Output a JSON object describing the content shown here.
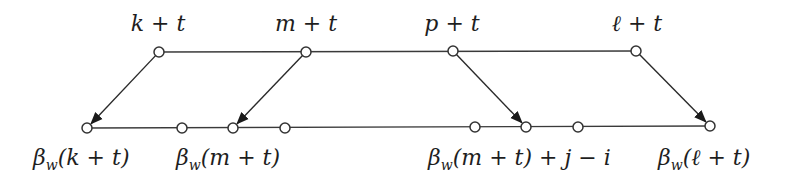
{
  "diagram": {
    "top_row": {
      "y": 52,
      "line": {
        "x1": 159,
        "x2": 636
      },
      "nodes": [
        {
          "id": "k+t",
          "x": 159,
          "y": 52,
          "label": "k + t",
          "label_x": 158,
          "label_y": 31
        },
        {
          "id": "m+t",
          "x": 306,
          "y": 52,
          "label": "m + t",
          "label_x": 306,
          "label_y": 31
        },
        {
          "id": "p+t",
          "x": 453,
          "y": 51,
          "label": "p + t",
          "label_x": 452,
          "label_y": 31
        },
        {
          "id": "l+t",
          "x": 636,
          "y": 51,
          "label": "ℓ + t",
          "label_x": 637,
          "label_y": 31
        }
      ]
    },
    "bottom_row": {
      "y": 128,
      "line": {
        "x1": 87,
        "x2": 710
      },
      "nodes": [
        {
          "id": "bw(k+t)",
          "x": 87,
          "y": 128
        },
        {
          "id": "b1",
          "x": 182,
          "y": 128
        },
        {
          "id": "bw(m+t)",
          "x": 233,
          "y": 128
        },
        {
          "id": "b3",
          "x": 285,
          "y": 128
        },
        {
          "id": "b4",
          "x": 475,
          "y": 127
        },
        {
          "id": "bw(m+t)+j-i",
          "x": 526,
          "y": 127
        },
        {
          "id": "b6",
          "x": 578,
          "y": 127
        },
        {
          "id": "bw(l+t)",
          "x": 710,
          "y": 126
        }
      ],
      "labels": [
        {
          "id": "label-bw-k",
          "beta": "β",
          "sub": "w",
          "rest": "(k + t)",
          "x": 33,
          "y": 165
        },
        {
          "id": "label-bw-m",
          "beta": "β",
          "sub": "w",
          "rest": "(m + t)",
          "x": 176,
          "y": 165
        },
        {
          "id": "label-bw-m-ji",
          "beta": "β",
          "sub": "w",
          "rest": "(m + t) + j − i",
          "x": 428,
          "y": 165
        },
        {
          "id": "label-bw-l",
          "beta": "β",
          "sub": "w",
          "rest": "(ℓ + t)",
          "x": 658,
          "y": 165
        }
      ]
    },
    "arrows": [
      {
        "from": "k+t",
        "to": "bw(k+t)",
        "x1": 159,
        "y1": 52,
        "x2": 87,
        "y2": 128
      },
      {
        "from": "m+t",
        "to": "bw(m+t)",
        "x1": 306,
        "y1": 52,
        "x2": 233,
        "y2": 128
      },
      {
        "from": "p+t",
        "to": "bw(m+t)+j-i",
        "x1": 453,
        "y1": 51,
        "x2": 526,
        "y2": 127
      },
      {
        "from": "l+t",
        "to": "bw(l+t)",
        "x1": 636,
        "y1": 51,
        "x2": 710,
        "y2": 126
      }
    ],
    "colors": {
      "stroke": "#333333",
      "text": "#1e1e1e",
      "background": "#ffffff"
    }
  }
}
